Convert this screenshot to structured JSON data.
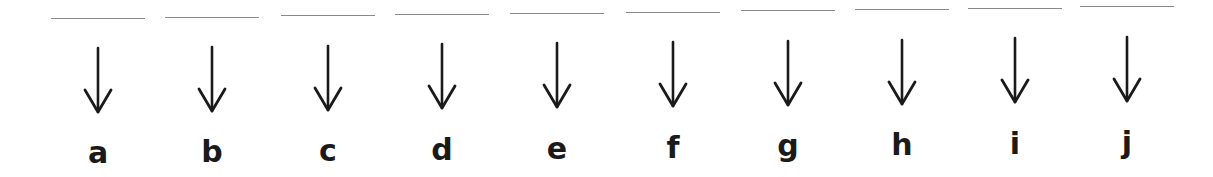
{
  "worksheet": {
    "columns": [
      {
        "letter": "a",
        "blank": ""
      },
      {
        "letter": "b",
        "blank": ""
      },
      {
        "letter": "c",
        "blank": ""
      },
      {
        "letter": "d",
        "blank": ""
      },
      {
        "letter": "e",
        "blank": ""
      },
      {
        "letter": "f",
        "blank": ""
      },
      {
        "letter": "g",
        "blank": ""
      },
      {
        "letter": "h",
        "blank": ""
      },
      {
        "letter": "i",
        "blank": ""
      },
      {
        "letter": "j",
        "blank": ""
      }
    ],
    "icon": "arrow-down-icon",
    "colors": {
      "line": "#8a8a8a",
      "ink": "#1a1a1a",
      "background": "#ffffff"
    }
  }
}
